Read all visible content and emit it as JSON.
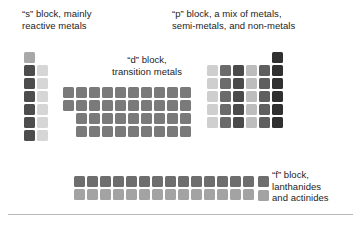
{
  "figure": {
    "captions": {
      "s_block": "“s” block, mainly\nreactive metals",
      "p_block": "“p” block, a mix of metals,\nsemi-metals, and non-metals",
      "d_block": "“d” block,\ntransition metals",
      "f_block": "“f” block,\nlanthanides\nand actinides"
    }
  },
  "colors": {
    "background": "#ffffff",
    "text": "#1c1c1c",
    "rule": "#b8b8b8",
    "s_group1": "#4d4d4d",
    "s_group2": "#d6d6d6",
    "s_hydrogen": "#a8a8a8",
    "d_block": "#7a7a7a",
    "f_lanthanide": "#6e6e6e",
    "f_actinide": "#a3a3a3",
    "p_col13": "#cfcfcf",
    "p_col14": "#6b6b6b",
    "p_col15": "#4a4a4a",
    "p_col16": "#bdbdbd",
    "p_col17": "#5f5f5f",
    "p_col18": "#303030"
  },
  "chart_data": {
    "type": "table",
    "cell_size_px": 11,
    "cell_gap_px": 2,
    "blocks": [
      {
        "name": "s",
        "label": "“s” block, mainly reactive metals",
        "columns": 2,
        "rows": 7,
        "origin": {
          "x": 24,
          "y": 52
        },
        "cells": [
          {
            "col": 0,
            "row": 0,
            "color": "#a8a8a8"
          },
          {
            "col": 0,
            "row": 1,
            "color": "#4d4d4d"
          },
          {
            "col": 1,
            "row": 1,
            "color": "#d6d6d6"
          },
          {
            "col": 0,
            "row": 2,
            "color": "#4d4d4d"
          },
          {
            "col": 1,
            "row": 2,
            "color": "#d6d6d6"
          },
          {
            "col": 0,
            "row": 3,
            "color": "#4d4d4d"
          },
          {
            "col": 1,
            "row": 3,
            "color": "#d6d6d6"
          },
          {
            "col": 0,
            "row": 4,
            "color": "#4d4d4d"
          },
          {
            "col": 1,
            "row": 4,
            "color": "#d6d6d6"
          },
          {
            "col": 0,
            "row": 5,
            "color": "#4d4d4d"
          },
          {
            "col": 1,
            "row": 5,
            "color": "#d6d6d6"
          },
          {
            "col": 0,
            "row": 6,
            "color": "#4d4d4d"
          },
          {
            "col": 1,
            "row": 6,
            "color": "#d6d6d6"
          }
        ]
      },
      {
        "name": "d",
        "label": "“d” block, transition metals",
        "columns": 10,
        "rows": 4,
        "origin": {
          "x": 63,
          "y": 87
        },
        "color": "#7a7a7a",
        "row_offsets": [
          0,
          0,
          1,
          1
        ],
        "row_counts": [
          10,
          10,
          9,
          9
        ]
      },
      {
        "name": "p",
        "label": "“p” block, a mix of metals, semi-metals, and non-metals",
        "columns": 6,
        "rows": 6,
        "origin": {
          "x": 207,
          "y": 52
        },
        "column_colors": [
          "#cfcfcf",
          "#6b6b6b",
          "#4a4a4a",
          "#bdbdbd",
          "#5f5f5f",
          "#303030"
        ],
        "row_offsets": [
          5,
          0,
          0,
          0,
          0,
          0
        ],
        "row_counts": [
          1,
          6,
          6,
          6,
          6,
          6
        ]
      },
      {
        "name": "f",
        "label": "“f” block, lanthanides and actinides",
        "columns": 14,
        "rows": 2,
        "origin": {
          "x": 74,
          "y": 176
        },
        "row_colors": [
          "#6e6e6e",
          "#a3a3a3"
        ]
      }
    ],
    "legend": [
      {
        "name": "lanthanides",
        "color": "#6e6e6e"
      },
      {
        "name": "actinides",
        "color": "#a3a3a3"
      }
    ]
  }
}
